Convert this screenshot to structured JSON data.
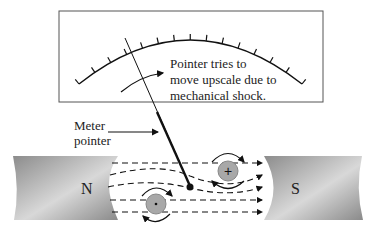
{
  "diagram": {
    "annotation": [
      "Pointer tries to",
      "move upscale due to",
      "mechanical shock."
    ],
    "pointer_label": [
      "Meter",
      "pointer"
    ],
    "poles": {
      "north": "N",
      "south": "S"
    },
    "conductors": {
      "upper": "+",
      "lower": "·"
    },
    "colors": {
      "magnet": "#9a9a9a",
      "conductor": "#a8a8a8",
      "line": "#111111",
      "frame": "#555555"
    },
    "scale_ticks": 15
  }
}
